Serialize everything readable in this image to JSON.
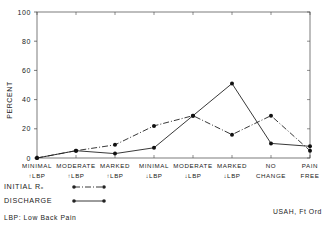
{
  "chart_data": {
    "type": "line",
    "title": "",
    "xlabel": "",
    "ylabel": "PERCENT",
    "ylim": [
      0,
      100
    ],
    "yticks": [
      0,
      20,
      40,
      60,
      80,
      100
    ],
    "grid": false,
    "categories": [
      [
        "MINIMAL",
        "↑LBP"
      ],
      [
        "MODERATE",
        "↑LBP"
      ],
      [
        "MARKED",
        "↑LBP"
      ],
      [
        "MINIMAL",
        "↓LBP"
      ],
      [
        "MODERATE",
        "↓LBP"
      ],
      [
        "MARKED",
        "↓LBP"
      ],
      [
        "NO",
        "CHANGE"
      ],
      [
        "PAIN",
        "FREE"
      ]
    ],
    "series": [
      {
        "name": "INITIAL Rx",
        "style": "dash-dot",
        "values": [
          0,
          5,
          9,
          22,
          29,
          16,
          29,
          5
        ]
      },
      {
        "name": "DISCHARGE",
        "style": "solid",
        "values": [
          0,
          5,
          3,
          7,
          29,
          51,
          10,
          8
        ]
      }
    ],
    "legend_position": "bottom-left"
  },
  "legend": {
    "initial_label": "INITIAL Rₓ",
    "discharge_label": "DISCHARGE"
  },
  "notes": {
    "abbreviation": "LBP: Low Back Pain",
    "source": "USAH, Ft Ord"
  },
  "colors": {
    "ink": "#222222",
    "background": "#ffffff"
  }
}
